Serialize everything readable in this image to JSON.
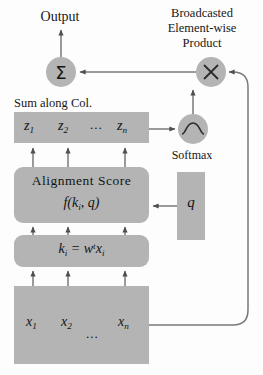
{
  "diagram": {
    "background_color": "#fdfdfd",
    "block_fill_color": "#b4b4b4",
    "stroke_color": "#555555",
    "labels": {
      "output": "Output",
      "broadcasted_product": "Broadcasted\nElement-wise\nProduct",
      "broadcasted_line1": "Broadcasted",
      "broadcasted_line2": "Element-wise",
      "broadcasted_line3": "Product",
      "sum_along_col": "Sum along Col.",
      "softmax": "Softmax"
    },
    "nodes": {
      "sum": {
        "symbol": "Σ",
        "name": "summation-node"
      },
      "multiply": {
        "symbol": "×",
        "name": "multiply-node"
      },
      "softmax": {
        "symbol": "sigmoid-curve",
        "name": "softmax-node"
      }
    },
    "z_row": {
      "items": [
        "z",
        "z",
        "z"
      ],
      "subscripts": [
        "1",
        "2",
        "n"
      ],
      "ellipsis": "..."
    },
    "alignment_block": {
      "title": "Alignment  Score",
      "function_base": "f(k",
      "function_sub": "i",
      "function_tail": ", q)"
    },
    "k_block": {
      "lhs": "k",
      "lhs_sub": "i",
      "equals": " = ",
      "w": "w",
      "w_sup": "t",
      "x": "x",
      "x_sub": "i"
    },
    "x_row": {
      "items": [
        "x",
        "x",
        "x"
      ],
      "subscripts": [
        "1",
        "2",
        "n"
      ],
      "ellipsis": "..."
    },
    "query_block": {
      "symbol": "q"
    }
  }
}
